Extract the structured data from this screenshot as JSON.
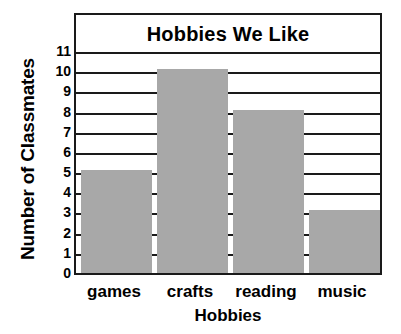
{
  "chart_data": {
    "type": "bar",
    "title": "Hobbies We Like",
    "xlabel": "Hobbies",
    "ylabel": "Number of Classmates",
    "categories": [
      "games",
      "crafts",
      "reading",
      "music"
    ],
    "values": [
      5,
      10,
      8,
      3
    ],
    "ylim": [
      0,
      11
    ],
    "ytick_labels": [
      "0",
      "1",
      "2",
      "3",
      "4",
      "5",
      "6",
      "7",
      "8",
      "9",
      "10",
      "11"
    ],
    "ytick_values": [
      0,
      1,
      2,
      3,
      4,
      5,
      6,
      7,
      8,
      9,
      10,
      11
    ],
    "grid": true,
    "legend": null,
    "bar_color": "#a8a8a8",
    "line_color": "#1a1a1a",
    "background": "#ffffff"
  }
}
